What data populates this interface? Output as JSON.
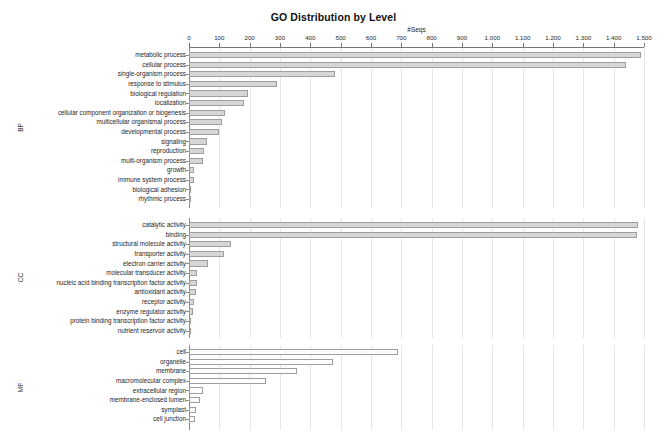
{
  "chart_data": {
    "type": "bar",
    "orientation": "horizontal",
    "title": "GO Distribution by Level",
    "xlabel": "#Seqs",
    "ylabel": "",
    "xlim": [
      0,
      1500
    ],
    "grid": true,
    "legend": "none",
    "xticks": [
      "0",
      "100",
      "200",
      "300",
      "400",
      "500",
      "600",
      "700",
      "800",
      "900",
      "1.000",
      "1.100",
      "1.200",
      "1.300",
      "1.400",
      "1.500"
    ],
    "xtick_values": [
      0,
      100,
      200,
      300,
      400,
      500,
      600,
      700,
      800,
      900,
      1000,
      1100,
      1200,
      1300,
      1400,
      1500
    ],
    "panels": [
      {
        "group": "BP",
        "group_label": "BP",
        "fill": "filled",
        "categories": [
          "metabolic process",
          "cellular process",
          "single-organism process",
          "response to stimulus",
          "biological regulation",
          "localization",
          "cellular component organization or biogenesis",
          "multicellular organismal process",
          "developmental process",
          "signaling",
          "reproduction",
          "multi-organism process",
          "growth",
          "immune system process",
          "biological adhesion",
          "rhythmic process"
        ],
        "values": [
          1490,
          1440,
          480,
          290,
          195,
          180,
          118,
          110,
          100,
          60,
          50,
          45,
          18,
          15,
          4,
          3
        ]
      },
      {
        "group": "CC",
        "group_label": "CC",
        "fill": "filled",
        "categories": [
          "catalytic activity",
          "binding",
          "structural molecule activity",
          "transporter activity",
          "electron carrier activity",
          "molecular transducer activity",
          "nucleic acid binding transcription factor activity",
          "antioxidant activity",
          "receptor activity",
          "enzyme regulator activity",
          "protein binding transcription factor activity",
          "nutrient reservoir activity"
        ],
        "values": [
          1480,
          1478,
          140,
          115,
          62,
          28,
          25,
          22,
          18,
          12,
          5,
          4
        ]
      },
      {
        "group": "MF",
        "group_label": "MF",
        "fill": "hollow",
        "categories": [
          "cell",
          "organelle",
          "membrane",
          "macromolecular complex",
          "extracellular region",
          "membrane-enclosed lumen",
          "symplast",
          "cell junction"
        ],
        "values": [
          690,
          475,
          355,
          255,
          45,
          35,
          22,
          20
        ]
      }
    ]
  },
  "colors": {
    "bar_fill": "#d6d6d6",
    "bar_hollow": "#fdfdfd",
    "bar_border": "#9e9e9e",
    "axis": "#8a8a8a",
    "gridline": "#e6e6e6",
    "text": "#1d1d1d",
    "background": "#ffffff"
  }
}
